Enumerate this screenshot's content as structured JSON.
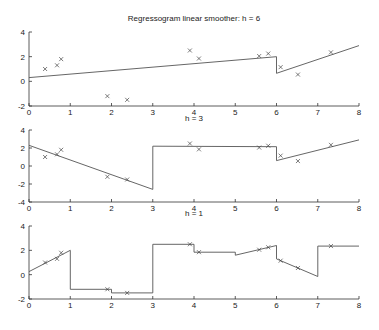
{
  "chart_data": [
    {
      "type": "line",
      "title": "Regressogram linear smoother: h = 6",
      "xlabel": "",
      "ylabel": "",
      "xlim": [
        0,
        8
      ],
      "ylim": [
        -2,
        4
      ],
      "xticks": [
        0,
        1,
        2,
        3,
        4,
        5,
        6,
        7,
        8
      ],
      "yticks": [
        -2,
        0,
        2,
        4
      ],
      "grid": false,
      "points": {
        "x": [
          0.39,
          0.68,
          0.78,
          1.9,
          2.38,
          3.9,
          4.12,
          5.58,
          5.8,
          6.1,
          6.52,
          7.32
        ],
        "y": [
          1.0,
          1.3,
          1.8,
          -1.2,
          -1.5,
          2.5,
          1.85,
          2.05,
          2.25,
          1.15,
          0.55,
          2.35
        ]
      },
      "smoother_segments": [
        [
          [
            0,
            0.3
          ],
          [
            6,
            2.0
          ],
          [
            6,
            0.65
          ],
          [
            8,
            2.9
          ]
        ]
      ]
    },
    {
      "type": "line",
      "title": "h = 3",
      "xlabel": "",
      "ylabel": "",
      "xlim": [
        0,
        8
      ],
      "ylim": [
        -4,
        4
      ],
      "xticks": [
        0,
        1,
        2,
        3,
        4,
        5,
        6,
        7,
        8
      ],
      "yticks": [
        -4,
        -2,
        0,
        2,
        4
      ],
      "grid": false,
      "points": {
        "x": [
          0.39,
          0.68,
          0.78,
          1.9,
          2.38,
          3.9,
          4.12,
          5.58,
          5.8,
          6.1,
          6.52,
          7.32
        ],
        "y": [
          1.0,
          1.3,
          1.8,
          -1.2,
          -1.5,
          2.5,
          1.85,
          2.05,
          2.25,
          1.15,
          0.55,
          2.35
        ]
      },
      "smoother_segments": [
        [
          [
            0,
            2.3
          ],
          [
            3,
            -2.6
          ],
          [
            3,
            2.2
          ],
          [
            6,
            2.15
          ],
          [
            6,
            0.6
          ],
          [
            8,
            2.9
          ]
        ]
      ]
    },
    {
      "type": "line",
      "title": "h = 1",
      "xlabel": "",
      "ylabel": "",
      "xlim": [
        0,
        8
      ],
      "ylim": [
        -2,
        4
      ],
      "xticks": [
        0,
        1,
        2,
        3,
        4,
        5,
        6,
        7,
        8
      ],
      "yticks": [
        -2,
        0,
        2,
        4
      ],
      "grid": false,
      "points": {
        "x": [
          0.39,
          0.68,
          0.78,
          1.9,
          2.38,
          3.9,
          4.12,
          5.58,
          5.8,
          6.1,
          6.52,
          7.32
        ],
        "y": [
          1.0,
          1.3,
          1.8,
          -1.2,
          -1.5,
          2.5,
          1.85,
          2.05,
          2.25,
          1.15,
          0.55,
          2.35
        ]
      },
      "smoother_segments": [
        [
          [
            0,
            0.25
          ],
          [
            1,
            2.0
          ],
          [
            1,
            -1.2
          ],
          [
            2,
            -1.2
          ],
          [
            2,
            -1.5
          ],
          [
            3,
            -1.5
          ],
          [
            3,
            2.5
          ],
          [
            4,
            2.5
          ],
          [
            4,
            1.85
          ],
          [
            5,
            1.85
          ],
          [
            5,
            1.6
          ],
          [
            6,
            2.4
          ],
          [
            6,
            1.3
          ],
          [
            7,
            -0.15
          ],
          [
            7,
            2.35
          ],
          [
            8,
            2.35
          ]
        ]
      ]
    }
  ]
}
